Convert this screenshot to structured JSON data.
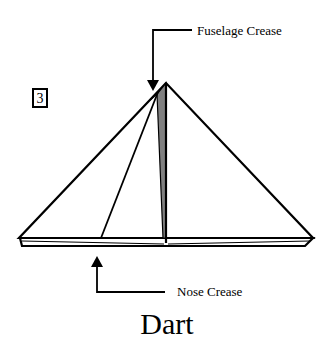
{
  "diagram": {
    "title": "Dart",
    "step_number": "3",
    "annotations": [
      {
        "id": "fuselage",
        "label": "Fuselage Crease",
        "arrow_direction": "down"
      },
      {
        "id": "nose",
        "label": "Nose Crease",
        "arrow_direction": "up"
      }
    ],
    "colors": {
      "line": "#000000",
      "paper": "#ffffff",
      "shaded_flap": "#808080"
    }
  }
}
